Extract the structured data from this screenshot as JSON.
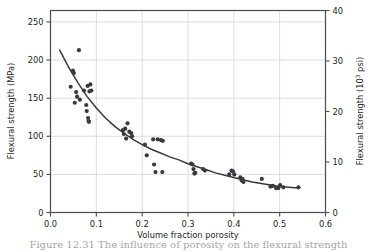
{
  "figure": {
    "caption": "Figure 12.31  The influence of porosity on the flexural strength"
  },
  "chart_data": {
    "type": "scatter",
    "title": "",
    "xlabel": "Volume fraction porosity",
    "ylabel": "Flexural strength (MPa)",
    "y2label": "Flexural strength (10",
    "y2label_sup": "3",
    "y2label_tail": " psi)",
    "xlim": [
      0.0,
      0.6
    ],
    "ylim": [
      0,
      265
    ],
    "y2lim": [
      0,
      40
    ],
    "grid": true,
    "legend": "none",
    "xticks": [
      "0.0",
      "0.1",
      "0.2",
      "0.3",
      "0.4",
      "0.5",
      "0.6"
    ],
    "xtick_values": [
      0.0,
      0.1,
      0.2,
      0.3,
      0.4,
      0.5,
      0.6
    ],
    "yticks": [
      "0",
      "50",
      "100",
      "150",
      "200",
      "250"
    ],
    "ytick_values": [
      0,
      50,
      100,
      150,
      200,
      250
    ],
    "y2ticks": [
      "0",
      "10",
      "20",
      "30",
      "40"
    ],
    "y2tick_values": [
      0,
      10,
      20,
      30,
      40
    ],
    "series": [
      {
        "name": "measurements",
        "type": "scatter",
        "marker": "circle",
        "color": "#3a3a3c",
        "points": [
          [
            0.044,
            165
          ],
          [
            0.049,
            186
          ],
          [
            0.051,
            183
          ],
          [
            0.053,
            144
          ],
          [
            0.056,
            158
          ],
          [
            0.058,
            152
          ],
          [
            0.062,
            213
          ],
          [
            0.064,
            148
          ],
          [
            0.073,
            160
          ],
          [
            0.078,
            141
          ],
          [
            0.079,
            133
          ],
          [
            0.081,
            166
          ],
          [
            0.082,
            124
          ],
          [
            0.083,
            120
          ],
          [
            0.084,
            119
          ],
          [
            0.085,
            159
          ],
          [
            0.087,
            168
          ],
          [
            0.089,
            160
          ],
          [
            0.158,
            108
          ],
          [
            0.16,
            103
          ],
          [
            0.163,
            110
          ],
          [
            0.165,
            97
          ],
          [
            0.168,
            117
          ],
          [
            0.172,
            106
          ],
          [
            0.176,
            104
          ],
          [
            0.178,
            100
          ],
          [
            0.206,
            89
          ],
          [
            0.21,
            75
          ],
          [
            0.224,
            96
          ],
          [
            0.226,
            63
          ],
          [
            0.229,
            53
          ],
          [
            0.234,
            96
          ],
          [
            0.241,
            95
          ],
          [
            0.244,
            53
          ],
          [
            0.245,
            94
          ],
          [
            0.307,
            64
          ],
          [
            0.31,
            63
          ],
          [
            0.312,
            57
          ],
          [
            0.314,
            51
          ],
          [
            0.316,
            52
          ],
          [
            0.333,
            57
          ],
          [
            0.337,
            55
          ],
          [
            0.39,
            50
          ],
          [
            0.395,
            55
          ],
          [
            0.398,
            54
          ],
          [
            0.401,
            50
          ],
          [
            0.414,
            46
          ],
          [
            0.417,
            42
          ],
          [
            0.419,
            44
          ],
          [
            0.421,
            40
          ],
          [
            0.461,
            44
          ],
          [
            0.48,
            34
          ],
          [
            0.485,
            35
          ],
          [
            0.492,
            32
          ],
          [
            0.497,
            32
          ],
          [
            0.501,
            36
          ],
          [
            0.508,
            33
          ],
          [
            0.541,
            33
          ]
        ]
      },
      {
        "name": "fitted-curve",
        "type": "line",
        "color": "#3a3a3c",
        "points": [
          [
            0.02,
            213
          ],
          [
            0.04,
            190
          ],
          [
            0.06,
            170
          ],
          [
            0.08,
            152
          ],
          [
            0.1,
            137
          ],
          [
            0.12,
            124
          ],
          [
            0.14,
            113
          ],
          [
            0.16,
            104
          ],
          [
            0.18,
            96
          ],
          [
            0.2,
            89
          ],
          [
            0.22,
            83
          ],
          [
            0.24,
            78
          ],
          [
            0.26,
            73
          ],
          [
            0.28,
            69
          ],
          [
            0.3,
            64
          ],
          [
            0.32,
            60
          ],
          [
            0.34,
            56
          ],
          [
            0.36,
            52
          ],
          [
            0.38,
            49
          ],
          [
            0.4,
            46
          ],
          [
            0.42,
            43
          ],
          [
            0.44,
            40
          ],
          [
            0.46,
            38
          ],
          [
            0.48,
            36
          ],
          [
            0.5,
            34
          ],
          [
            0.52,
            33
          ],
          [
            0.54,
            32
          ]
        ]
      }
    ]
  }
}
